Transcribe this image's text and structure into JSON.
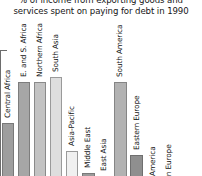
{
  "chart_data": {
    "type": "bar",
    "title": "% of income from exporting goods and services spent on paying for debt in 1990",
    "title_lines": [
      "% of income from exporting goods and",
      "services spent on paying for debt in 1990"
    ],
    "xlabel": "",
    "ylabel": "",
    "ylim": [
      0,
      35
    ],
    "grid": false,
    "legend": "none",
    "y_tick_values": [
      0,
      5,
      10,
      15,
      20,
      25,
      30,
      35
    ],
    "y_ticklabels_visible": false,
    "orientation": "vertical",
    "note": "Y axis tick labels are cropped off the left edge of the screenshot; bar baseline is cropped off the bottom edge.",
    "categories": [
      "Central Africa",
      "E. and S. Africa",
      "Northern Africa",
      "South Asia",
      "Asia-Pacific",
      "Middle East",
      "East Asia",
      "South America",
      "Eastern Europe",
      "North America",
      "Western Europe",
      "Japan"
    ],
    "values": [
      19,
      28,
      28,
      29,
      13,
      8,
      7.5,
      28,
      12,
      1.5,
      0.8,
      0.4
    ],
    "bars": [
      {
        "label": "Central Africa",
        "value": 19,
        "color": "#9e9e9e",
        "edge": "#787878"
      },
      {
        "label": "E. and S. Africa",
        "value": 28,
        "color": "#a6a6a6",
        "edge": "#7d7d7d"
      },
      {
        "label": "Northern Africa",
        "value": 28,
        "color": "#c3c3c3",
        "edge": "#8a8a8a"
      },
      {
        "label": "South Asia",
        "value": 29,
        "color": "#dedede",
        "edge": "#9a9a9a"
      },
      {
        "label": "Asia-Pacific",
        "value": 13,
        "color": "#f0f0f0",
        "edge": "#9a9a9a"
      },
      {
        "label": "Middle East",
        "value": 8,
        "color": "#9a9a9a",
        "edge": "#7a7a7a"
      },
      {
        "label": "East Asia",
        "value": 7.5,
        "color": "#ededed",
        "edge": "#9e9e9e"
      },
      {
        "label": "South America",
        "value": 28,
        "color": "#b2b2b2",
        "edge": "#858585"
      },
      {
        "label": "Eastern Europe",
        "value": 12,
        "color": "#8f8f8f",
        "edge": "#6f6f6f"
      },
      {
        "label": "North America",
        "value": 1.5,
        "color": "#b8b8b8",
        "edge": "#8a8a8a"
      },
      {
        "label": "Western Europe",
        "value": 0.8,
        "color": "#c9c9c9",
        "edge": "#949494"
      },
      {
        "label": "Japan",
        "value": 0.4,
        "color": "#d8d8d8",
        "edge": "#9c9c9c"
      }
    ]
  }
}
